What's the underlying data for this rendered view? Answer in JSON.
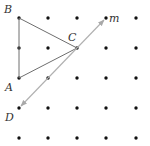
{
  "diagram": {
    "type": "dot-grid-geometry",
    "grid": {
      "columns": [
        19,
        48,
        77,
        106,
        136
      ],
      "rows": [
        18,
        48,
        78,
        108,
        138
      ],
      "dot_radius": 1.7,
      "dot_color": "#111111"
    },
    "points": {
      "B": {
        "label": "B",
        "x": 19,
        "y": 18,
        "label_x": 4,
        "label_y": 13
      },
      "C": {
        "label": "C",
        "x": 77,
        "y": 48,
        "label_x": 68,
        "label_y": 41
      },
      "A": {
        "label": "A",
        "x": 19,
        "y": 78,
        "label_x": 5,
        "label_y": 91
      },
      "D": {
        "label": "D",
        "x": 19,
        "y": 108,
        "label_x": 5,
        "label_y": 121
      }
    },
    "triangle": {
      "name": "ABC",
      "vertices": [
        "A",
        "B",
        "C"
      ],
      "stroke": "#6e6e6e"
    },
    "line_m": {
      "label": "m",
      "through": [
        "C",
        "D"
      ],
      "start": {
        "x": 21,
        "y": 106
      },
      "end": {
        "x": 104,
        "y": 20
      },
      "label_x": 109,
      "label_y": 22,
      "stroke": "#b0b0b0",
      "arrows": "both"
    }
  }
}
